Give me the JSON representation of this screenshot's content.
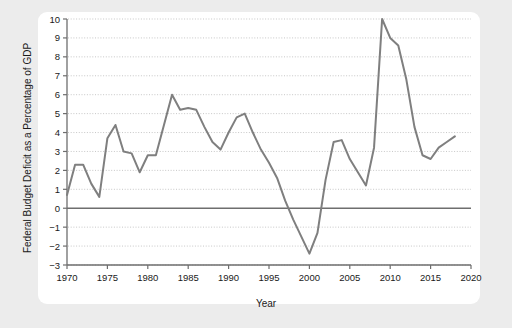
{
  "page": {
    "background_color": "#ececec",
    "card_color": "#ffffff"
  },
  "ghost": {
    "top_text": "",
    "bottom_text": ""
  },
  "chart_data": {
    "type": "line",
    "title": "",
    "xlabel": "Year",
    "ylabel": "Federal Budget Deficit as a Percentage of GDP",
    "xlim": [
      1970,
      2020
    ],
    "ylim": [
      -3,
      10
    ],
    "xticks": [
      1970,
      1975,
      1980,
      1985,
      1990,
      1995,
      2000,
      2005,
      2010,
      2015,
      2020
    ],
    "yticks": [
      -3,
      -2,
      -1,
      0,
      1,
      2,
      3,
      4,
      5,
      6,
      7,
      8,
      9,
      10
    ],
    "xtick_labels": [
      "1970",
      "1975",
      "1980",
      "1985",
      "1990",
      "1995",
      "2000",
      "2005",
      "2010",
      "2015",
      "2020"
    ],
    "ytick_labels": [
      "-3",
      "-2",
      "-1",
      "0",
      "1",
      "2",
      "3",
      "4",
      "5",
      "6",
      "7",
      "8",
      "9",
      "10"
    ],
    "grid": true,
    "grid_style": "dotted-horizontal",
    "legend": false,
    "line_color": "#7f7f7f",
    "axis_color": "#6e6e6e",
    "zero_reference_line": 0,
    "x": [
      1970,
      1971,
      1972,
      1973,
      1974,
      1975,
      1976,
      1977,
      1978,
      1979,
      1980,
      1981,
      1982,
      1983,
      1984,
      1985,
      1986,
      1987,
      1988,
      1989,
      1990,
      1991,
      1992,
      1993,
      1994,
      1995,
      1996,
      1997,
      1998,
      1999,
      2000,
      2001,
      2002,
      2003,
      2004,
      2005,
      2006,
      2007,
      2008,
      2009,
      2010,
      2011,
      2012,
      2013,
      2014,
      2015,
      2016,
      2017,
      2018
    ],
    "values": [
      0.7,
      2.3,
      2.3,
      1.3,
      0.6,
      3.7,
      4.4,
      3.0,
      2.9,
      1.9,
      2.8,
      2.8,
      4.4,
      6.0,
      5.2,
      5.3,
      5.2,
      4.3,
      3.5,
      3.1,
      4.0,
      4.8,
      5.0,
      4.0,
      3.1,
      2.4,
      1.6,
      0.4,
      -0.6,
      -1.5,
      -2.4,
      -1.3,
      1.5,
      3.5,
      3.6,
      2.6,
      1.9,
      1.2,
      3.2,
      10.0,
      9.0,
      8.6,
      6.8,
      4.3,
      2.8,
      2.6,
      3.2,
      3.5,
      3.8
    ]
  }
}
